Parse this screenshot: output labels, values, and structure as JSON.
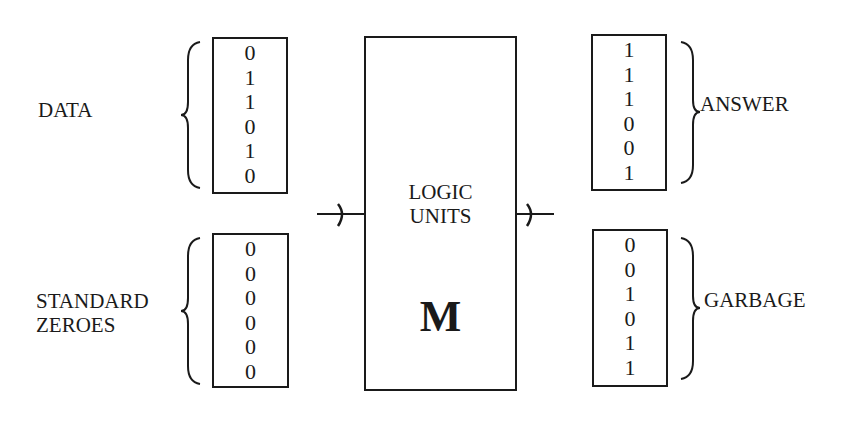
{
  "inputs": {
    "data": {
      "label": "DATA",
      "bits": [
        "0",
        "1",
        "1",
        "0",
        "1",
        "0"
      ]
    },
    "standard_zeroes": {
      "label_lines": [
        "STANDARD",
        "ZEROES"
      ],
      "bits": [
        "0",
        "0",
        "0",
        "0",
        "0",
        "0"
      ]
    }
  },
  "logic_units": {
    "label_lines": [
      "LOGIC",
      "UNITS"
    ],
    "symbol": "M"
  },
  "outputs": {
    "answer": {
      "label": "ANSWER",
      "bits": [
        "1",
        "1",
        "1",
        "0",
        "0",
        "1"
      ]
    },
    "garbage": {
      "label": "GARBAGE",
      "bits": [
        "0",
        "0",
        "1",
        "0",
        "1",
        "1"
      ]
    }
  }
}
